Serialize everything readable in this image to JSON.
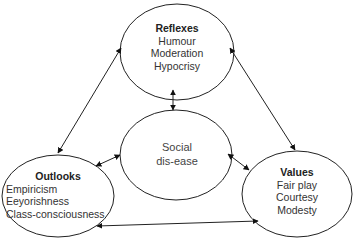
{
  "diagram": {
    "nodes": [
      {
        "id": "reflexes",
        "title": "Reflexes",
        "items": [
          "Humour",
          "Moderation",
          "Hypocrisy"
        ]
      },
      {
        "id": "social",
        "title": "Social",
        "subtitle": "dis-ease"
      },
      {
        "id": "outlooks",
        "title": "Outlooks",
        "items": [
          "Empiricism",
          "Eeyorishness",
          "Class-consciousness"
        ]
      },
      {
        "id": "values",
        "title": "Values",
        "items": [
          "Fair play",
          "Courtesy",
          "Modesty"
        ]
      }
    ],
    "edges": [
      {
        "from": "reflexes",
        "to": "outlooks",
        "bidirectional": true
      },
      {
        "from": "reflexes",
        "to": "values",
        "bidirectional": true
      },
      {
        "from": "reflexes",
        "to": "social",
        "bidirectional": true
      },
      {
        "from": "social",
        "to": "outlooks",
        "bidirectional": true
      },
      {
        "from": "social",
        "to": "values",
        "bidirectional": true
      },
      {
        "from": "outlooks",
        "to": "values",
        "bidirectional": true
      }
    ],
    "colors": {
      "stroke": "#222222",
      "text": "#333333",
      "background": "#ffffff"
    }
  }
}
